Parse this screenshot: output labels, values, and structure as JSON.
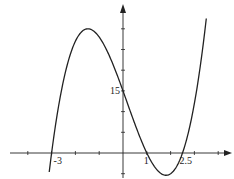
{
  "chart_data": {
    "type": "line",
    "title": "",
    "xlabel": "",
    "ylabel": "",
    "function": "f(x) = 2(x+3)(x-1)(x-2.5)",
    "xlim": [
      -4.1,
      4.5
    ],
    "ylim": [
      -6,
      33
    ],
    "x_tick_step": 1,
    "y_tick_step": 5,
    "x_tick_labels": [
      {
        "value": -3,
        "label": "-3"
      },
      {
        "value": 1,
        "label": "1"
      },
      {
        "value": 2.5,
        "label": "2.5"
      }
    ],
    "y_tick_labels": [
      {
        "value": 15,
        "label": "15"
      }
    ],
    "series": [
      {
        "name": "curve",
        "x_range": [
          -3.1,
          3.5
        ],
        "roots": [
          -3,
          1,
          2.5
        ],
        "y_intercept": 15,
        "local_max": {
          "x": -1.5,
          "y": 30
        },
        "local_min": {
          "x": 1.85,
          "y": -5.4
        }
      }
    ],
    "grid": false,
    "legend": "none",
    "color": "#222222"
  }
}
